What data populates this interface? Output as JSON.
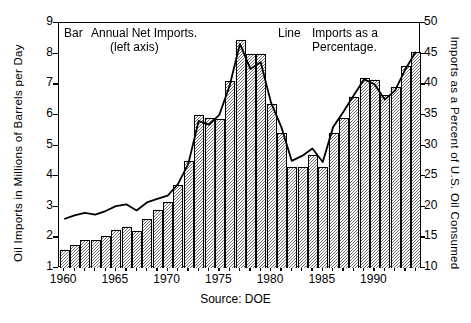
{
  "axes": {
    "y_left_title": "Oil Imports in Millions of Barrels per Day",
    "y_right_title": "Imports as a Percent of U.S. Oil Consumed",
    "y_left_ticks": [
      "9",
      "8",
      "7",
      "6",
      "5",
      "4",
      "3",
      "2",
      "1"
    ],
    "y_right_ticks": [
      "50",
      "45",
      "40",
      "35",
      "30",
      "25",
      "20",
      "15",
      "10"
    ],
    "x_ticks": [
      "1960",
      "1965",
      "1970",
      "1975",
      "1980",
      "1985",
      "1990"
    ]
  },
  "legend": {
    "bar_key": "Bar",
    "bar_text_line1": "Annual Net Imports.",
    "bar_text_line2": "(left axis)",
    "line_key": "Line",
    "line_text_line1": "Imports as a",
    "line_text_line2": "Percentage."
  },
  "source": "Source: DOE",
  "colors": {
    "axis": "#000000",
    "bar_fill": "#b9b9b9",
    "bar_edge": "#000000",
    "line": "#000000",
    "background": "#ffffff"
  },
  "chart_data": {
    "type": "bar",
    "title": "",
    "subtitle": "",
    "xlabel": "",
    "ylabel": "Oil Imports in Millions of Barrels per Day",
    "y2label": "Imports as a Percent of U.S. Oil Consumed",
    "grid": false,
    "legend_position": "top-inside",
    "xlim": [
      1959.5,
      1994.5
    ],
    "ylim": [
      1,
      9
    ],
    "y2lim": [
      10,
      50
    ],
    "categories": [
      1960,
      1961,
      1962,
      1963,
      1964,
      1965,
      1966,
      1967,
      1968,
      1969,
      1970,
      1971,
      1972,
      1973,
      1974,
      1975,
      1976,
      1977,
      1978,
      1979,
      1980,
      1981,
      1982,
      1983,
      1984,
      1985,
      1986,
      1987,
      1988,
      1989,
      1990,
      1991,
      1992,
      1993,
      1994
    ],
    "series": [
      {
        "name": "Annual Net Imports.",
        "type": "bar",
        "axis": "left",
        "unit": "Million Barrels per Day",
        "values": [
          1.6,
          1.75,
          1.9,
          1.9,
          2.05,
          2.25,
          2.35,
          2.2,
          2.6,
          2.9,
          3.15,
          3.7,
          4.5,
          6.0,
          5.9,
          5.85,
          7.1,
          8.45,
          8.0,
          8.0,
          6.35,
          5.4,
          4.3,
          4.3,
          4.7,
          4.3,
          5.4,
          5.9,
          6.6,
          7.2,
          7.15,
          6.65,
          6.9,
          7.6,
          8.05
        ]
      },
      {
        "name": "Imports as a Percentage.",
        "type": "line",
        "axis": "right",
        "unit": "Percent of U.S. Oil Consumed",
        "values": [
          18.0,
          18.6,
          19.0,
          18.7,
          19.3,
          20.1,
          20.4,
          19.4,
          20.7,
          21.3,
          21.8,
          23.7,
          27.0,
          34.0,
          33.4,
          35.0,
          39.8,
          46.6,
          42.5,
          43.6,
          37.0,
          33.0,
          27.5,
          28.3,
          29.5,
          27.3,
          33.0,
          35.5,
          38.2,
          40.8,
          40.0,
          37.5,
          39.0,
          42.5,
          45.3
        ]
      }
    ]
  }
}
